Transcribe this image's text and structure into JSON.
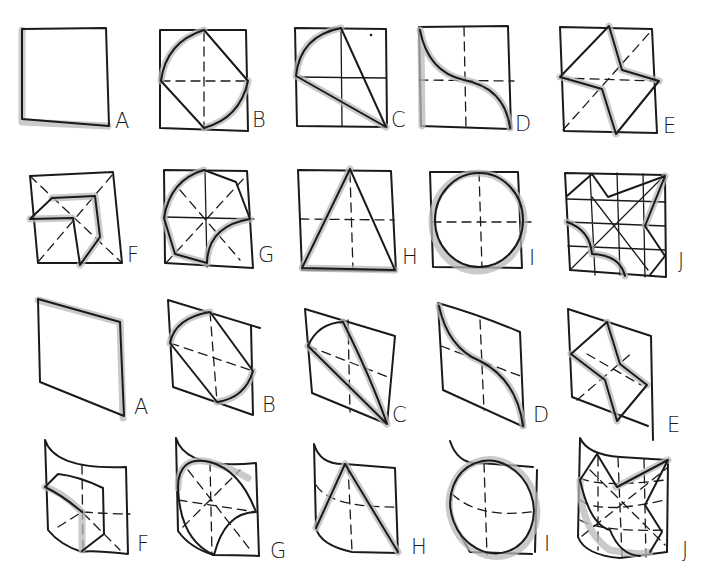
{
  "diagram": {
    "colors": {
      "ink": "#1a1a1a",
      "shading": "#b8b8b8",
      "background": "#ffffff"
    },
    "rows": [
      {
        "name": "flat-row-1",
        "labels": [
          "A",
          "B",
          "C",
          "D",
          "E"
        ]
      },
      {
        "name": "flat-row-2",
        "labels": [
          "F",
          "G",
          "H",
          "I",
          "J"
        ]
      },
      {
        "name": "skewed-row-1",
        "labels": [
          "A",
          "B",
          "C",
          "D",
          "E"
        ]
      },
      {
        "name": "curved-row-2",
        "labels": [
          "F",
          "G",
          "H",
          "I",
          "J"
        ]
      }
    ],
    "figures": {
      "A": "square",
      "B": "square with diamond and two arcs",
      "C": "square with quarter arc and triangle",
      "D": "square with S-curve",
      "E": "square with four-point star",
      "F": "square with L-shape / hexagonal fold",
      "G": "square with rounded blob and concave arc",
      "H": "square with inscribed triangle",
      "I": "square with inscribed circle",
      "J": "grid square with concave star shape"
    }
  }
}
